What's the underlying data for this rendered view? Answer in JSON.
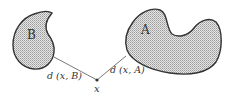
{
  "diagram": {
    "type": "set-distance-illustration",
    "sets": [
      {
        "name": "B",
        "label": "B"
      },
      {
        "name": "A",
        "label": "A"
      }
    ],
    "point": {
      "label": "x"
    },
    "distance_labels": {
      "to_B": "d (x, B)",
      "to_A": "d (x, A)"
    },
    "colors": {
      "outline": "#333333",
      "fill": "#c8c8c8",
      "line": "#555555"
    }
  }
}
